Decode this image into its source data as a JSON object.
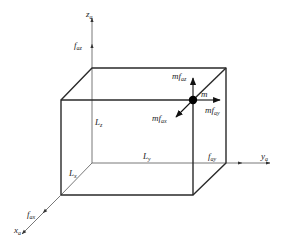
{
  "diagram": {
    "axes": {
      "z": {
        "label": "z",
        "subscript": "a",
        "force_label": "f",
        "force_subscript": "az"
      },
      "y": {
        "label": "y",
        "subscript": "a",
        "force_label": "f",
        "force_subscript": "ay"
      },
      "x": {
        "label": "x",
        "subscript": "a",
        "force_label": "f",
        "force_subscript": "ax"
      }
    },
    "dimensions": {
      "z": {
        "label": "L",
        "subscript": "z"
      },
      "y": {
        "label": "L",
        "subscript": "y"
      },
      "x": {
        "label": "L",
        "subscript": "x"
      }
    },
    "mass": {
      "label": "m",
      "forces": [
        {
          "id": "z",
          "label": "mf",
          "subscript": "az"
        },
        {
          "id": "y",
          "label": "mf",
          "subscript": "ay"
        },
        {
          "id": "x",
          "label": "mf",
          "subscript": "ax"
        }
      ]
    },
    "colors": {
      "line": "#2a2a2a",
      "axis": "#555555",
      "dot": "#000000"
    }
  }
}
